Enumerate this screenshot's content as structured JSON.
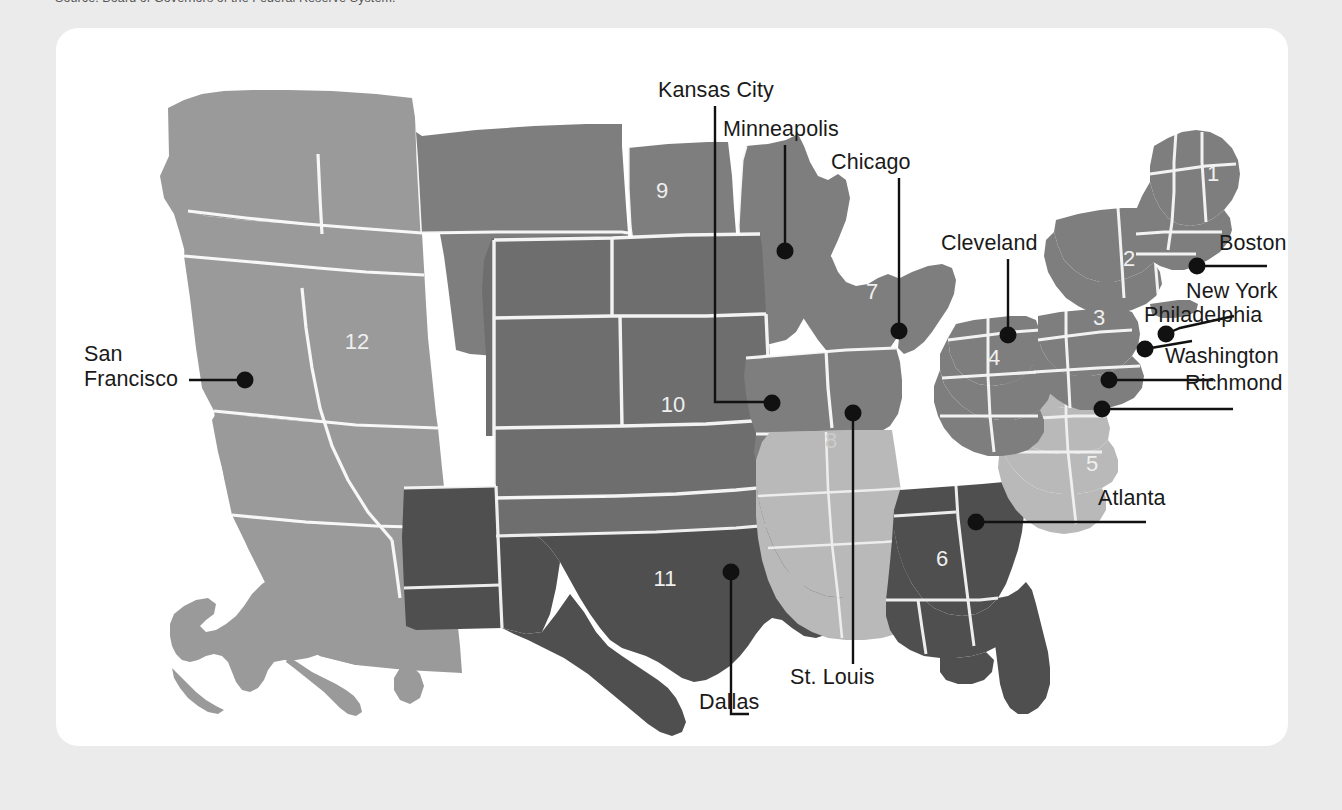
{
  "source_note": "Source: Board of Governors of the Federal Reserve System.",
  "card": {
    "name": "federal-reserve-district-map"
  },
  "colors": {
    "page_bg": "#ebebeb",
    "card_bg": "#ffffff",
    "district_light": "#b9b9b9",
    "district_medium": "#9a9a9a",
    "district_mid_dark": "#7e7e7e",
    "district_dark": "#6e6e6e",
    "district_darkest": "#4f4f4f",
    "border": "#ffffff",
    "leader_line": "#111111",
    "dot": "#111111",
    "number_text": "#efefef",
    "label_text": "#1a1a1a"
  },
  "districts": [
    {
      "number": "1",
      "city": "Boston",
      "shade": "medium",
      "num_x": 1157,
      "num_y": 153
    },
    {
      "number": "2",
      "city": "New York",
      "shade": "medium",
      "num_x": 1073,
      "num_y": 238
    },
    {
      "number": "3",
      "city": "Philadelphia",
      "shade": "medium",
      "num_x": 1043,
      "num_y": 297
    },
    {
      "number": "4",
      "city": "Cleveland",
      "shade": "medium",
      "num_x": 938,
      "num_y": 337
    },
    {
      "number": "5",
      "city": "Richmond",
      "shade": "light",
      "num_x": 1036,
      "num_y": 443
    },
    {
      "number": "6",
      "city": "Atlanta",
      "shade": "darkest",
      "num_x": 886,
      "num_y": 538
    },
    {
      "number": "7",
      "city": "Chicago",
      "shade": "medium",
      "num_x": 816,
      "num_y": 271
    },
    {
      "number": "8",
      "city": "St. Louis",
      "shade": "light",
      "num_x": 775,
      "num_y": 420
    },
    {
      "number": "9",
      "city": "Minneapolis",
      "shade": "medium",
      "num_x": 606,
      "num_y": 170
    },
    {
      "number": "10",
      "city": "Kansas City",
      "shade": "mid_dark",
      "num_x": 617,
      "num_y": 384
    },
    {
      "number": "11",
      "city": "Dallas",
      "shade": "darkest",
      "num_x": 609,
      "num_y": 558
    },
    {
      "number": "12",
      "city": "San Francisco",
      "shade": "medium",
      "num_x": 301,
      "num_y": 321
    }
  ],
  "city_labels": [
    {
      "name": "kansas-city",
      "text": "Kansas City",
      "x": 658,
      "y": 64,
      "lines": [
        "Kansas City"
      ]
    },
    {
      "name": "minneapolis",
      "text": "Minneapolis",
      "x": 723,
      "y": 103,
      "lines": [
        "Minneapolis"
      ]
    },
    {
      "name": "chicago",
      "text": "Chicago",
      "x": 831,
      "y": 136,
      "lines": [
        "Chicago"
      ]
    },
    {
      "name": "cleveland",
      "text": "Cleveland",
      "x": 941,
      "y": 217,
      "lines": [
        "Cleveland"
      ]
    },
    {
      "name": "boston",
      "text": "Boston",
      "x": 1219,
      "y": 227,
      "lines": [
        "Boston"
      ]
    },
    {
      "name": "new-york",
      "text": "New York",
      "x": 1186,
      "y": 275,
      "lines": [
        "New York"
      ]
    },
    {
      "name": "philadelphia",
      "text": "Philadelphia",
      "x": 1144,
      "y": 299,
      "lines": [
        "Philadelphia"
      ]
    },
    {
      "name": "washington",
      "text": "Washington",
      "x": 1165,
      "y": 340,
      "lines": [
        "Washington"
      ]
    },
    {
      "name": "richmond",
      "text": "Richmond",
      "x": 1185,
      "y": 367,
      "lines": [
        "Richmond"
      ]
    },
    {
      "name": "atlanta",
      "text": "Atlanta",
      "x": 1098,
      "y": 482,
      "lines": [
        "Atlanta"
      ]
    },
    {
      "name": "san-francisco",
      "text": "San Francisco",
      "x": 84,
      "y": 338,
      "lines": [
        "San",
        "Francisco"
      ]
    },
    {
      "name": "dallas",
      "text": "Dallas",
      "x": 699,
      "y": 676,
      "lines": [
        "Dallas"
      ]
    },
    {
      "name": "st-louis",
      "text": "St. Louis",
      "x": 790,
      "y": 651,
      "lines": [
        "St. Louis"
      ]
    }
  ],
  "city_dots": [
    {
      "name": "dot-kansas-city",
      "x": 716,
      "y": 375
    },
    {
      "name": "dot-minneapolis",
      "x": 729,
      "y": 223
    },
    {
      "name": "dot-chicago",
      "x": 843,
      "y": 303
    },
    {
      "name": "dot-cleveland",
      "x": 952,
      "y": 307
    },
    {
      "name": "dot-boston",
      "x": 1141,
      "y": 238
    },
    {
      "name": "dot-new-york",
      "x": 1110,
      "y": 306
    },
    {
      "name": "dot-philadelphia",
      "x": 1089,
      "y": 321
    },
    {
      "name": "dot-washington",
      "x": 1053,
      "y": 352
    },
    {
      "name": "dot-richmond",
      "x": 1046,
      "y": 381
    },
    {
      "name": "dot-atlanta",
      "x": 920,
      "y": 494
    },
    {
      "name": "dot-san-francisco",
      "x": 189,
      "y": 352
    },
    {
      "name": "dot-dallas",
      "x": 675,
      "y": 544
    },
    {
      "name": "dot-st-louis",
      "x": 797,
      "y": 385
    }
  ]
}
